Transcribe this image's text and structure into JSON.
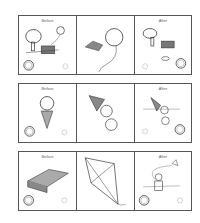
{
  "worksheet": {
    "rows": [
      {
        "id": "balloon",
        "panels": [
          {
            "label": "Before",
            "scene": "tree, park bench, balloon",
            "smiley": "happy-circled"
          },
          {
            "label": "",
            "scene": "balloon caught / popped on bush"
          },
          {
            "label": "After",
            "scene": "tree, bench, deflated balloon",
            "smiley": "sad-circled"
          }
        ]
      },
      {
        "id": "ice-cream",
        "panels": [
          {
            "label": "Before",
            "scene": "ice cream cone",
            "smiley": "happy-circled"
          },
          {
            "label": "",
            "scene": "ice cream falling off cone"
          },
          {
            "label": "After",
            "scene": "ice cream on ground",
            "smiley": "sad-circled"
          }
        ]
      },
      {
        "id": "kite",
        "panels": [
          {
            "label": "Before",
            "scene": "kite in box",
            "smiley": "happy-circled"
          },
          {
            "label": "",
            "scene": "assembled kite"
          },
          {
            "label": "After",
            "scene": "child flying kite",
            "smiley": "happy-circled"
          }
        ]
      }
    ]
  }
}
